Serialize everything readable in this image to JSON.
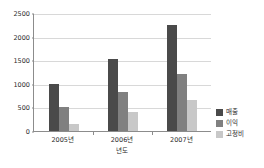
{
  "chart_data": {
    "type": "bar",
    "title": "",
    "xlabel": "년도",
    "ylabel": "",
    "categories": [
      "2005년",
      "2006년",
      "2007년"
    ],
    "series": [
      {
        "name": "매출",
        "color": "#4a4a4a",
        "values": [
          1000,
          1530,
          2250
        ]
      },
      {
        "name": "이익",
        "color": "#808080",
        "values": [
          500,
          830,
          1210
        ]
      },
      {
        "name": "고정비",
        "color": "#c8c8c8",
        "values": [
          150,
          410,
          660
        ]
      }
    ],
    "ylim": [
      0,
      2500
    ],
    "ytick_values": [
      0,
      500,
      1000,
      1500,
      2000,
      2500
    ],
    "ytick_labels": [
      "0",
      "500",
      "1000",
      "1500",
      "2000",
      "2500"
    ],
    "grid": true,
    "legend_position": "right"
  }
}
